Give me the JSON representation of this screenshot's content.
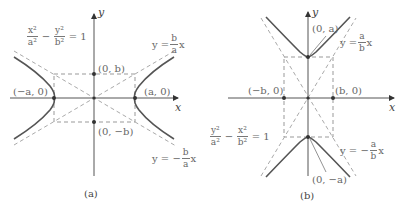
{
  "panels": [
    {
      "id": "a",
      "caption": "(a)",
      "axis_x": "x",
      "axis_y": "y",
      "equation": {
        "t1_num": "x²",
        "t1_den": "a²",
        "minus": "−",
        "t2_num": "y²",
        "t2_den": "b²",
        "rhs": "= 1"
      },
      "asymptote_pos": {
        "prefix": "y =",
        "num": "b",
        "den": "a",
        "suffix": "x"
      },
      "asymptote_neg": {
        "prefix": "y = −",
        "num": "b",
        "den": "a",
        "suffix": "x"
      },
      "points": {
        "top": "(0, b)",
        "bottom": "(0, −b)",
        "left": "(−a, 0)",
        "right": "(a, 0)"
      }
    },
    {
      "id": "b",
      "caption": "(b)",
      "axis_x": "x",
      "axis_y": "y",
      "equation": {
        "t1_num": "y²",
        "t1_den": "a²",
        "minus": "−",
        "t2_num": "x²",
        "t2_den": "b²",
        "rhs": "= 1"
      },
      "asymptote_pos": {
        "prefix": "y =",
        "num": "a",
        "den": "b",
        "suffix": "x"
      },
      "asymptote_neg": {
        "prefix": "y = −",
        "num": "a",
        "den": "b",
        "suffix": "x"
      },
      "points": {
        "top": "(0, a)",
        "bottom": "(0, −a)",
        "left": "(−b, 0)",
        "right": "(b, 0)"
      }
    }
  ],
  "colors": {
    "curve": "#555555",
    "axis": "#555555",
    "dashed": "#999999",
    "point": "#333333"
  }
}
